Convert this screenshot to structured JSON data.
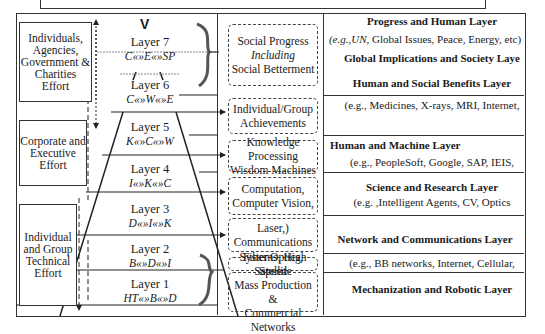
{
  "efforts": [
    {
      "label": "Individuals, Agencies, Government & Charities Effort"
    },
    {
      "label": "Corporate and Executive Effort"
    },
    {
      "label": "Individual and Group Technical Effort"
    }
  ],
  "top_marker": "V",
  "layers": [
    {
      "name": "Layer 7",
      "formula": "C«»E«»SP"
    },
    {
      "name": "Layer  6",
      "formula": "C«»W«»E"
    },
    {
      "name": "Layer  5",
      "formula": "K«»C«»W"
    },
    {
      "name": "Layer 4",
      "formula": "I«»K«»C"
    },
    {
      "name": "Layer 3",
      "formula": "D«»I«»K"
    },
    {
      "name": "Layer 2",
      "formula": "B«»D«»I"
    },
    {
      "name": "Layer 1",
      "formula": "HT«»B«»D"
    }
  ],
  "boxes": [
    {
      "lines": [
        "Social Progress",
        "Including",
        "Social Betterment"
      ]
    },
    {
      "lines": [
        "Individual/Group",
        "Achievements"
      ]
    },
    {
      "lines": [
        "Knowledge Processing",
        "Wisdom Machines"
      ]
    },
    {
      "lines": [
        "Computation,",
        "Computer Vision,"
      ]
    },
    {
      "lines": [
        "Laser,)",
        "Communications"
      ]
    },
    {
      "lines": [
        "Fiber Optics, Satellite"
      ]
    },
    {
      "lines": [
        "Systems, High Speed",
        "Mass Production &",
        "Commercial Networks"
      ]
    }
  ],
  "right": [
    {
      "title": "Progress and Human Layer",
      "example_prefix": "(e.g.,UN,",
      "example": " Global Issues, Peace, Energy, etc)",
      "title2": "Global Implications and Society Laye"
    },
    {
      "title": "Human and Social Benefits Layer",
      "example": "(e.g., Medicines, X-rays, MRI, Internet,"
    },
    {
      "title": "Human and Machine Layer",
      "example": "(e.g., PeopleSoft, Google, SAP, IEIS,"
    },
    {
      "title": "Science and Research Layer",
      "example": "(e.g. ,Intelligent Agents, CV, Optics"
    },
    {
      "title": "Network and Communications Layer",
      "example": "(e.g., BB networks, Internet, Cellular,"
    },
    {
      "title": "Mechanization and Robotic Layer"
    }
  ]
}
